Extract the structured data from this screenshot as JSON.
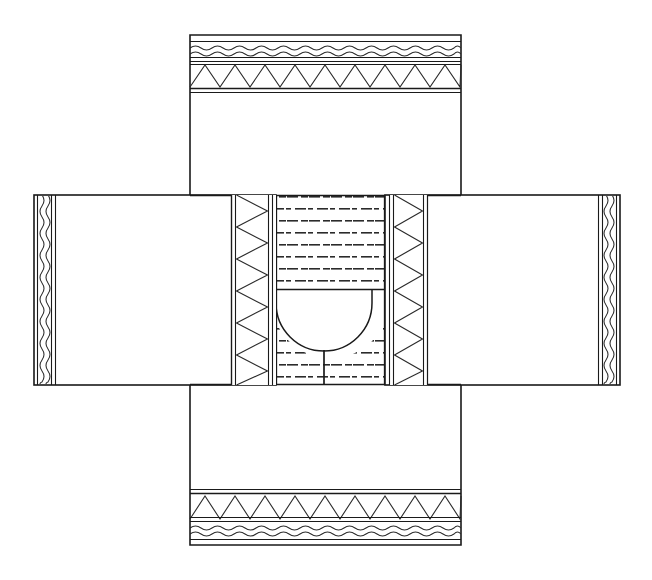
{
  "figure": {
    "type": "technical-line-drawing",
    "canvas": {
      "width": 652,
      "height": 580
    },
    "background_color": "#ffffff",
    "line_color": "#1a1a1a",
    "hatch_color": "#2b2b2b",
    "fill_color": "#ffffff",
    "stroke_width_outline": 1.6,
    "stroke_width_inner": 1.1,
    "stroke_width_hatch": 1.0
  },
  "geometry": {
    "vertical_body": {
      "x1": 190,
      "y1": 35,
      "x2": 461,
      "y2": 545
    },
    "left_wing": {
      "x1": 34,
      "y1": 195,
      "x2": 276,
      "y2": 385
    },
    "right_wing": {
      "x1": 385,
      "y1": 195,
      "x2": 620,
      "y2": 385
    },
    "center_hatch": {
      "x1": 276,
      "y1": 195,
      "x2": 385,
      "y2": 385
    },
    "left_zigzag_column": {
      "x1": 231,
      "y1": 195,
      "x2": 276,
      "y2": 385
    },
    "right_zigzag_column": {
      "x1": 385,
      "y1": 195,
      "x2": 425,
      "y2": 385
    },
    "top_wave_band": {
      "x1": 190,
      "y1": 42,
      "x2": 461,
      "y2": 60
    },
    "top_zigzag_band": {
      "x1": 190,
      "y1": 64,
      "x2": 461,
      "y2": 88
    },
    "bottom_zigzag_band": {
      "x1": 190,
      "y1": 495,
      "x2": 461,
      "y2": 520
    },
    "bottom_wave_band": {
      "x1": 190,
      "y1": 523,
      "x2": 461,
      "y2": 540
    },
    "bowl": {
      "cx": 322,
      "top_y": 290,
      "left_x": 276,
      "right_x": 376,
      "bottom_y": 358,
      "radius": 50
    },
    "bowl_stem": {
      "x": 322,
      "y1": 358,
      "y2": 385
    }
  },
  "regions": [
    {
      "id": "vertical-body",
      "label": "Vertical body outline",
      "pattern": "none",
      "interactable": false
    },
    {
      "id": "top-wave-band",
      "label": "Top wavy hatch band",
      "pattern": "wave",
      "wave_amplitude": 4,
      "wave_period": 11,
      "wave_rows": 2,
      "interactable": false
    },
    {
      "id": "top-zigzag-band",
      "label": "Top triangular zigzag band",
      "pattern": "zigzag",
      "zigzag_period": 30,
      "interactable": false
    },
    {
      "id": "bottom-zigzag-band",
      "label": "Bottom triangular zigzag band",
      "pattern": "zigzag",
      "zigzag_period": 30,
      "interactable": false
    },
    {
      "id": "bottom-wave-band",
      "label": "Bottom wavy hatch band",
      "pattern": "wave",
      "wave_amplitude": 4,
      "wave_period": 11,
      "wave_rows": 2,
      "interactable": false
    },
    {
      "id": "left-wing",
      "label": "Left horizontal wing",
      "pattern": "none",
      "edge_pattern": "vertical-wave",
      "interactable": false
    },
    {
      "id": "right-wing",
      "label": "Right horizontal wing",
      "pattern": "none",
      "edge_pattern": "vertical-wave",
      "interactable": false
    },
    {
      "id": "left-zigzag-column",
      "label": "Left vertical zigzag column",
      "pattern": "vertical-zigzag",
      "zigzag_period": 32,
      "interactable": false
    },
    {
      "id": "right-zigzag-column",
      "label": "Right vertical zigzag column",
      "pattern": "vertical-zigzag",
      "zigzag_period": 32,
      "interactable": false
    },
    {
      "id": "center-hatch",
      "label": "Central dashed brick hatch core",
      "pattern": "dashed-brick",
      "dash_length": 11,
      "row_spacing": 12,
      "col_spacing": 22,
      "interactable": false
    },
    {
      "id": "bowl-cavity",
      "label": "Central U-shaped cavity",
      "pattern": "none",
      "interactable": false
    },
    {
      "id": "bowl-stem",
      "label": "Cavity stem line",
      "pattern": "line",
      "interactable": false
    }
  ]
}
